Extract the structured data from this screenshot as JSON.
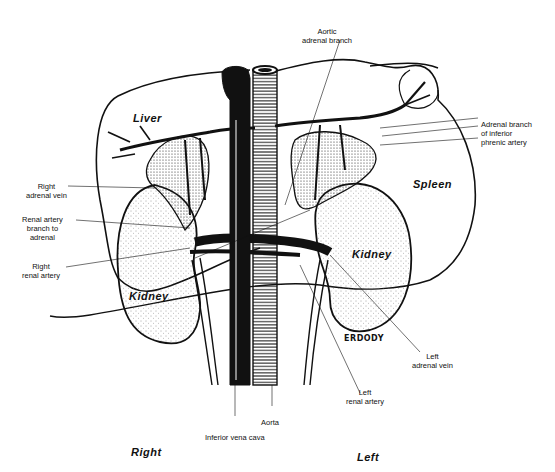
{
  "diagram": {
    "organs": {
      "liver": "Liver",
      "spleen": "Spleen",
      "kidney_right": "Kidney",
      "kidney_left": "Kidney"
    },
    "labels": {
      "aortic_adrenal_branch": [
        "Aortic",
        "adrenal branch"
      ],
      "adrenal_branch_inferior_phrenic": [
        "Adrenal branch",
        "of inferior",
        "phrenic artery"
      ],
      "right_adrenal_vein": [
        "Right",
        "adrenal vein"
      ],
      "renal_artery_branch": [
        "Renal artery",
        "branch to",
        "adrenal"
      ],
      "right_renal_artery": [
        "Right",
        "renal artery"
      ],
      "left_adrenal_vein": [
        "Left",
        "adrenal vein"
      ],
      "left_renal_artery": [
        "Left",
        "renal artery"
      ],
      "aorta": "Aorta",
      "inferior_vena_cava": "Inferior vena cava"
    },
    "orientation": {
      "right": "Right",
      "left": "Left"
    },
    "signature": "ERDODY"
  }
}
